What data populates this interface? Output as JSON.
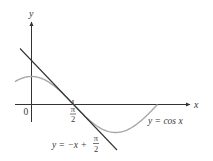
{
  "figure": {
    "type": "function-graph",
    "axes": {
      "x_label": "x",
      "y_label": "y",
      "origin_label": "0",
      "x_tick_label": {
        "numerator": "π",
        "denominator": "2"
      }
    },
    "curves": [
      {
        "name": "cosine",
        "label_text": "y = cos x",
        "color": "#a8a8a8",
        "domain": [
          "-0.6",
          "3π/2"
        ]
      },
      {
        "name": "tangent",
        "label_prefix": "y = −x + ",
        "label_fraction": {
          "numerator": "π",
          "denominator": "2"
        },
        "color": "#333333"
      }
    ],
    "colors": {
      "axis": "#333333",
      "tangent": "#333333",
      "curve": "#a8a8a8",
      "text": "#3a3a3a"
    }
  },
  "chart_data": {
    "type": "line",
    "title": "",
    "xlabel": "x",
    "ylabel": "y",
    "x_ticks": [
      "0",
      "π/2"
    ],
    "series": [
      {
        "name": "y = cos x",
        "x": [
          -0.6,
          0,
          0.785,
          1.571,
          2.356,
          3.142,
          3.927,
          4.712
        ],
        "values": [
          0.825,
          1,
          0.707,
          0,
          -0.707,
          -1,
          -0.707,
          0
        ]
      },
      {
        "name": "y = -x + π/2",
        "x": [
          -0.4,
          0,
          1.571,
          3.25
        ],
        "values": [
          1.971,
          1.571,
          0,
          -1.679
        ]
      }
    ],
    "annotations": [
      "y = cos x",
      "y = −x + π/2"
    ],
    "grid": false
  }
}
